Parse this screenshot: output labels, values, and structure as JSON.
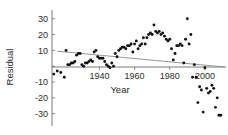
{
  "chart_data": {
    "type": "scatter",
    "title": "",
    "xlabel": "Year",
    "ylabel": "Residual",
    "xlim": [
      1913,
      2012
    ],
    "ylim": [
      -34,
      33
    ],
    "grid": false,
    "legend": null,
    "xticks": [
      1940,
      1960,
      1980,
      2000
    ],
    "xtick_labels": [
      "1940",
      "1960",
      "1980",
      "2000"
    ],
    "yticks": [
      30,
      20,
      10,
      0,
      -10,
      -20,
      -30
    ],
    "ytick_labels": [
      "30",
      "20",
      "10",
      "0",
      "-10",
      "-20",
      "-30"
    ],
    "series": [
      {
        "name": "Residual",
        "marker": "filled-circle",
        "color": "#111111",
        "points": [
          [
            1914,
            -5
          ],
          [
            1916,
            -3
          ],
          [
            1918,
            -4
          ],
          [
            1920,
            -7
          ],
          [
            1921,
            10
          ],
          [
            1922,
            1
          ],
          [
            1923,
            1
          ],
          [
            1924,
            2
          ],
          [
            1925,
            2
          ],
          [
            1926,
            3
          ],
          [
            1927,
            7
          ],
          [
            1928,
            8
          ],
          [
            1929,
            8
          ],
          [
            1930,
            1
          ],
          [
            1931,
            0
          ],
          [
            1932,
            2
          ],
          [
            1933,
            2
          ],
          [
            1934,
            3
          ],
          [
            1935,
            4
          ],
          [
            1936,
            3
          ],
          [
            1937,
            9
          ],
          [
            1938,
            10
          ],
          [
            1939,
            6
          ],
          [
            1940,
            5
          ],
          [
            1941,
            5
          ],
          [
            1942,
            5
          ],
          [
            1943,
            3
          ],
          [
            1944,
            1
          ],
          [
            1945,
            0
          ],
          [
            1946,
            -1
          ],
          [
            1947,
            2
          ],
          [
            1948,
            0
          ],
          [
            1949,
            8
          ],
          [
            1950,
            6
          ],
          [
            1951,
            10
          ],
          [
            1952,
            11
          ],
          [
            1953,
            12
          ],
          [
            1954,
            12
          ],
          [
            1955,
            11
          ],
          [
            1956,
            13
          ],
          [
            1957,
            13
          ],
          [
            1958,
            14
          ],
          [
            1959,
            9
          ],
          [
            1960,
            14
          ],
          [
            1961,
            16
          ],
          [
            1962,
            11
          ],
          [
            1963,
            13
          ],
          [
            1964,
            14
          ],
          [
            1965,
            18
          ],
          [
            1966,
            14
          ],
          [
            1967,
            18
          ],
          [
            1968,
            20
          ],
          [
            1969,
            21
          ],
          [
            1970,
            20
          ],
          [
            1971,
            26
          ],
          [
            1972,
            22
          ],
          [
            1973,
            21
          ],
          [
            1974,
            22
          ],
          [
            1975,
            20
          ],
          [
            1976,
            21
          ],
          [
            1977,
            19
          ],
          [
            1978,
            17
          ],
          [
            1979,
            16
          ],
          [
            1980,
            17
          ],
          [
            1981,
            11
          ],
          [
            1982,
            4
          ],
          [
            1983,
            8
          ],
          [
            1984,
            13
          ],
          [
            1985,
            13
          ],
          [
            1986,
            14
          ],
          [
            1987,
            13
          ],
          [
            1988,
            2
          ],
          [
            1989,
            17
          ],
          [
            1990,
            30
          ],
          [
            1991,
            14
          ],
          [
            1992,
            20
          ],
          [
            1993,
            -7
          ],
          [
            1994,
            1
          ],
          [
            1995,
            -7
          ],
          [
            1996,
            -23
          ],
          [
            1997,
            -13
          ],
          [
            1998,
            -15
          ],
          [
            1999,
            -29
          ],
          [
            2000,
            -1
          ],
          [
            2001,
            -14
          ],
          [
            2002,
            -17
          ],
          [
            2003,
            -16
          ],
          [
            2004,
            -12
          ],
          [
            2005,
            -14
          ],
          [
            2006,
            -26
          ],
          [
            2007,
            -20
          ],
          [
            2008,
            -31
          ],
          [
            2009,
            -31
          ]
        ]
      }
    ],
    "trendline": {
      "name": "linear-fit",
      "color": "#8a8a8a",
      "x_start": 1916,
      "y_start": 9.5,
      "x_end": 2011,
      "y_end": -0.5
    }
  }
}
